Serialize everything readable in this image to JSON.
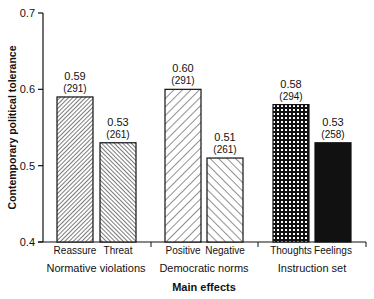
{
  "chart_data": {
    "type": "bar",
    "title": "",
    "xlabel": "Main effects",
    "ylabel": "Contemporary political tolerance",
    "ylim": [
      0.4,
      0.7
    ],
    "yticks": [
      "0.4",
      "0.5",
      "0.6",
      "0.7"
    ],
    "grid": false,
    "legend": null,
    "groups": [
      {
        "name": "Normative violations",
        "bars": [
          {
            "label": "Reassure",
            "value": 0.59,
            "value_label": "0.59",
            "n_label": "(291)",
            "pattern": "fine-diagonal-right"
          },
          {
            "label": "Threat",
            "value": 0.53,
            "value_label": "0.53",
            "n_label": "(261)",
            "pattern": "fine-diagonal-left"
          }
        ]
      },
      {
        "name": "Democratic norms",
        "bars": [
          {
            "label": "Positive",
            "value": 0.6,
            "value_label": "0.60",
            "n_label": "(291)",
            "pattern": "wide-diagonal-right"
          },
          {
            "label": "Negative",
            "value": 0.51,
            "value_label": "0.51",
            "n_label": "(261)",
            "pattern": "wide-diagonal-left"
          }
        ]
      },
      {
        "name": "Instruction set",
        "bars": [
          {
            "label": "Thoughts",
            "value": 0.58,
            "value_label": "0.58",
            "n_label": "(294)",
            "pattern": "checker"
          },
          {
            "label": "Feelings",
            "value": 0.53,
            "value_label": "0.53",
            "n_label": "(258)",
            "pattern": "solid-black"
          }
        ]
      }
    ],
    "categories": [
      "Reassure",
      "Threat",
      "Positive",
      "Negative",
      "Thoughts",
      "Feelings"
    ],
    "values": [
      0.59,
      0.53,
      0.6,
      0.51,
      0.58,
      0.53
    ],
    "sample_sizes": [
      291,
      261,
      291,
      261,
      294,
      258
    ]
  }
}
